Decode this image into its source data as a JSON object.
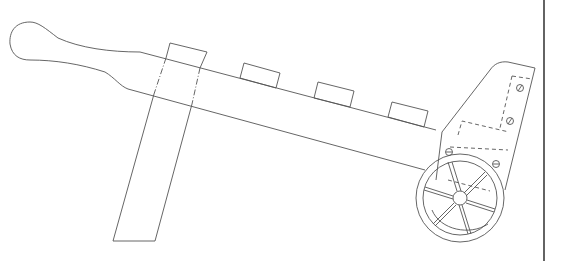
{
  "diagram": {
    "line_color": "#555555",
    "background": "#ffffff",
    "parts": [
      {
        "id": "handle",
        "label": "handle"
      },
      {
        "id": "main-beam",
        "label": "main beam"
      },
      {
        "id": "leg",
        "label": "leg"
      },
      {
        "id": "blocks",
        "label": "blocks",
        "count": 4
      },
      {
        "id": "bracket",
        "label": "wheel bracket"
      },
      {
        "id": "screws",
        "label": "screws",
        "count": 4
      },
      {
        "id": "wheel",
        "label": "wheel",
        "spokes": 6
      }
    ]
  }
}
